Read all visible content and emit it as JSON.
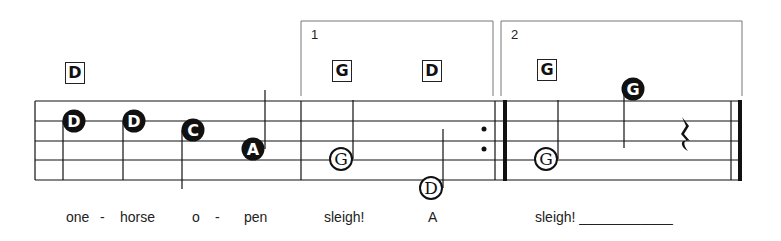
{
  "score": {
    "staff": {
      "left": 35,
      "right": 742,
      "lines_y": [
        101,
        121,
        141,
        160,
        180
      ]
    },
    "endings": [
      {
        "number": "1",
        "left": 301,
        "right": 493,
        "top": 21,
        "bottom": 96
      },
      {
        "number": "2",
        "left": 501,
        "right": 742,
        "top": 21,
        "bottom": 96
      }
    ],
    "chords": [
      {
        "name": "D",
        "x": 65,
        "y": 62
      },
      {
        "name": "G",
        "x": 332,
        "y": 60
      },
      {
        "name": "D",
        "x": 422,
        "y": 60
      },
      {
        "name": "G",
        "x": 537,
        "y": 59
      }
    ],
    "notes": [
      {
        "letter": "D",
        "style": "filled",
        "cx": 74,
        "cy": 121,
        "stem": "down"
      },
      {
        "letter": "D",
        "style": "filled",
        "cx": 134,
        "cy": 121,
        "stem": "down"
      },
      {
        "letter": "C",
        "style": "filled",
        "cx": 193,
        "cy": 130,
        "stem": "down"
      },
      {
        "letter": "A",
        "style": "filled",
        "cx": 253,
        "cy": 149,
        "stem": "up"
      },
      {
        "letter": "G",
        "style": "open",
        "cx": 341,
        "cy": 159,
        "stem": "up"
      },
      {
        "letter": "D",
        "style": "open",
        "cx": 431,
        "cy": 188,
        "stem": "up"
      },
      {
        "letter": "G",
        "style": "open",
        "cx": 546,
        "cy": 159,
        "stem": "up"
      },
      {
        "letter": "G",
        "style": "filled",
        "cx": 633,
        "cy": 89,
        "stem": "down"
      }
    ],
    "lyrics": [
      {
        "text": "one",
        "x": 66
      },
      {
        "text": "-",
        "x": 100
      },
      {
        "text": "horse",
        "x": 120
      },
      {
        "text": "o",
        "x": 192
      },
      {
        "text": "-",
        "x": 215
      },
      {
        "text": "pen",
        "x": 244
      },
      {
        "text": "sleigh!",
        "x": 324
      },
      {
        "text": "A",
        "x": 428
      },
      {
        "text": "sleigh! ____________",
        "x": 535
      }
    ],
    "colors": {
      "ink": "#111111",
      "bracket": "#777777"
    }
  }
}
